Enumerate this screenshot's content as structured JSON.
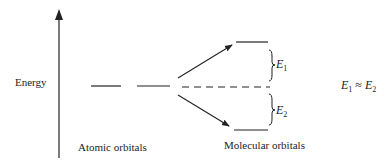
{
  "diagram": {
    "axis_label": "Energy",
    "atomic_label": "Atomic orbitals",
    "molecular_label": "Molecular orbitals",
    "gap_upper": {
      "symbol": "E",
      "sub": "1"
    },
    "gap_lower": {
      "symbol": "E",
      "sub": "2"
    },
    "relation": {
      "lhs": "E",
      "lhs_sub": "1",
      "op": " ≈ ",
      "rhs": "E",
      "rhs_sub": "2"
    },
    "colors": {
      "line": "#222222",
      "background": "#ffffff"
    }
  }
}
